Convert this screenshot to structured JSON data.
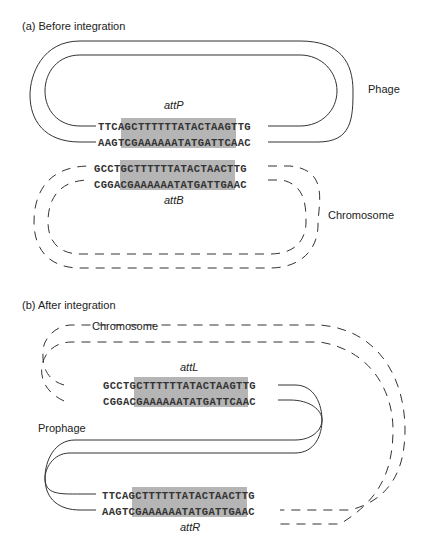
{
  "panel_a": {
    "title": "(a) Before integration",
    "phage_label": "Phage",
    "chromosome_label": "Chromosome",
    "attP": {
      "label": "attP",
      "top": {
        "left": "TTCA",
        "core": "GCTTTTTTATACTAA",
        "right": "GTTG"
      },
      "bottom": {
        "left": "AAGT",
        "core": "CGAAAAAATATGATT",
        "right": "CAAC"
      }
    },
    "attB": {
      "label": "attB",
      "top": {
        "left": "GCCT",
        "core": "GCTTTTTTATACTAA",
        "right": "CTTG"
      },
      "bottom": {
        "left": "CGGA",
        "core": "CGAAAAAATATGATT",
        "right": "GAAC"
      }
    }
  },
  "panel_b": {
    "title": "(b) After integration",
    "chromosome_label": "Chromosome",
    "prophage_label": "Prophage",
    "attL": {
      "label": "attL",
      "top": {
        "left": "GCCT",
        "core": "GCTTTTTTATACTAA",
        "right": "GTTG"
      },
      "bottom": {
        "left": "CGGA",
        "core": "CGAAAAAATATGATT",
        "right": "CAAC"
      }
    },
    "attR": {
      "label": "attR",
      "top": {
        "left": "TTCA",
        "core": "GCTTTTTTATACTAA",
        "right": "CTTG"
      },
      "bottom": {
        "left": "AAGT",
        "core": "CGAAAAAATATGATT",
        "right": "GAAC"
      }
    }
  },
  "colors": {
    "core_shading": "#b5b5b5",
    "line": "#333333"
  }
}
